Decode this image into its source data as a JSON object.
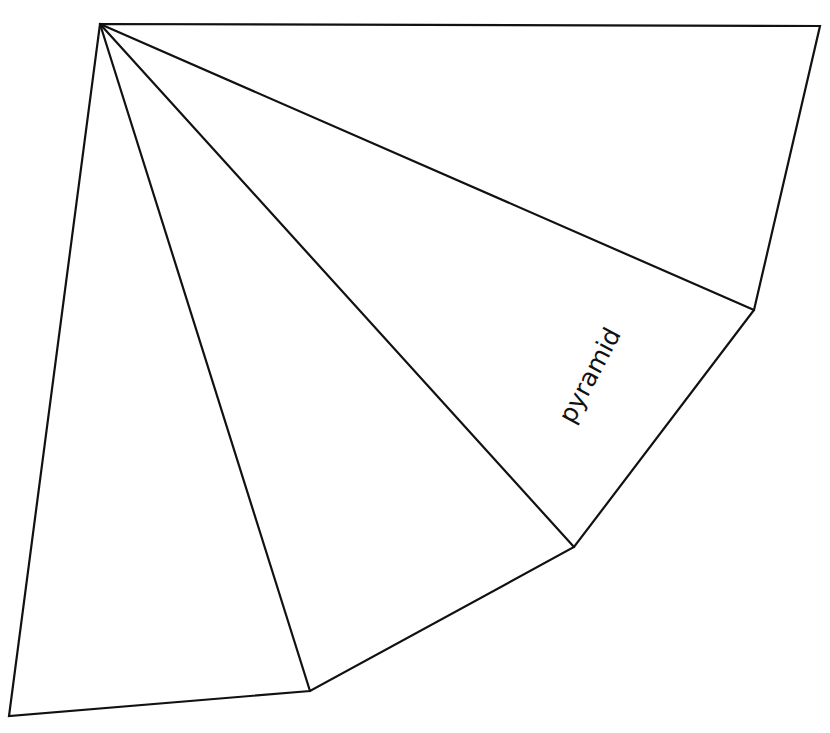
{
  "diagram": {
    "label": "pyramid",
    "line_color": "#111111",
    "background": "#ffffff",
    "vertices": {
      "apex": [
        100,
        24
      ],
      "top_right": [
        820,
        26
      ],
      "right": [
        754,
        310
      ],
      "mid": [
        574,
        547
      ],
      "lower": [
        310,
        691
      ],
      "bottom_left": [
        9,
        716
      ]
    },
    "faces": [
      {
        "name": "face-1",
        "points": [
          "apex",
          "bottom_left",
          "lower"
        ]
      },
      {
        "name": "face-2",
        "points": [
          "apex",
          "lower",
          "mid"
        ]
      },
      {
        "name": "face-3",
        "points": [
          "apex",
          "mid",
          "right"
        ]
      },
      {
        "name": "face-4",
        "points": [
          "apex",
          "right",
          "top_right"
        ]
      }
    ]
  }
}
